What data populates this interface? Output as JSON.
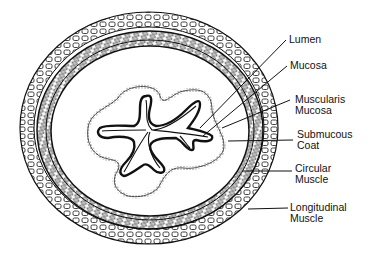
{
  "diagram": {
    "labels": [
      {
        "id": "lumen",
        "lines": [
          "Lumen"
        ],
        "x": 289,
        "y": 34
      },
      {
        "id": "mucosa",
        "lines": [
          "Mucosa"
        ],
        "x": 290,
        "y": 60
      },
      {
        "id": "muscularis-mucosa",
        "lines": [
          "Muscularis",
          "Mucosa"
        ],
        "x": 295,
        "y": 94
      },
      {
        "id": "submucous-coat",
        "lines": [
          "Submucous",
          "Coat"
        ],
        "x": 297,
        "y": 129
      },
      {
        "id": "circular-muscle",
        "lines": [
          "Circular",
          "Muscle"
        ],
        "x": 295,
        "y": 163
      },
      {
        "id": "longitudinal-muscle",
        "lines": [
          "Longitudinal",
          "Muscle"
        ],
        "x": 290,
        "y": 202
      }
    ]
  }
}
